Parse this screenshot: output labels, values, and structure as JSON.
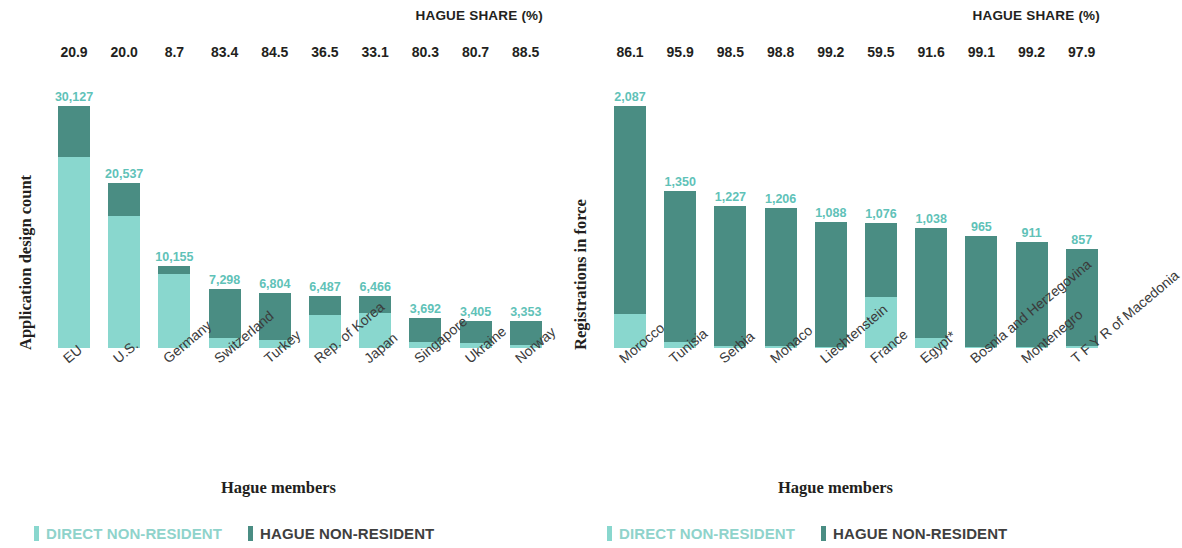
{
  "chart_data": [
    {
      "id": "left",
      "type": "bar",
      "stacked": true,
      "title": "",
      "header_label": "HAGUE SHARE (%)",
      "ylabel": "Application design count",
      "xlabel": "Hague members",
      "categories": [
        "EU",
        "U.S.",
        "Germany",
        "Switzerland",
        "Turkey",
        "Rep. of Korea",
        "Japan",
        "Singapore",
        "Ukraine",
        "Norway"
      ],
      "values": [
        30127,
        20537,
        10155,
        7298,
        6804,
        6487,
        6466,
        3692,
        3405,
        3353
      ],
      "value_labels": [
        "30,127",
        "20,537",
        "10,155",
        "7,298",
        "6,804",
        "6,487",
        "6,466",
        "3,692",
        "3,405",
        "3,353"
      ],
      "hague_share": [
        20.9,
        20.0,
        8.7,
        83.4,
        84.5,
        36.5,
        33.1,
        80.3,
        80.7,
        88.5
      ],
      "hague_share_labels": [
        "20.9",
        "20.0",
        "8.7",
        "83.4",
        "84.5",
        "36.5",
        "33.1",
        "80.3",
        "80.7",
        "88.5"
      ],
      "series": [
        {
          "name": "DIRECT NON-RESIDENT",
          "color": "#89d7ce"
        },
        {
          "name": "HAGUE NON-RESIDENT",
          "color": "#4a8d83"
        }
      ],
      "ylim": [
        0,
        30127
      ],
      "grid": false,
      "legend_position": "bottom-left"
    },
    {
      "id": "right",
      "type": "bar",
      "stacked": true,
      "title": "",
      "header_label": "HAGUE SHARE (%)",
      "ylabel": "Registrations in force",
      "xlabel": "Hague members",
      "categories": [
        "Morocco",
        "Tunisia",
        "Serbia",
        "Monaco",
        "Liechtenstein",
        "France",
        "Egypt*",
        "Bosnia and Herzegovina",
        "Montenegro",
        "T F Y R of Macedonia"
      ],
      "values": [
        2087,
        1350,
        1227,
        1206,
        1088,
        1076,
        1038,
        965,
        911,
        857
      ],
      "value_labels": [
        "2,087",
        "1,350",
        "1,227",
        "1,206",
        "1,088",
        "1,076",
        "1,038",
        "965",
        "911",
        "857"
      ],
      "hague_share": [
        86.1,
        95.9,
        98.5,
        98.8,
        99.2,
        59.5,
        91.6,
        99.1,
        99.2,
        97.9
      ],
      "hague_share_labels": [
        "86.1",
        "95.9",
        "98.5",
        "98.8",
        "99.2",
        "59.5",
        "91.6",
        "99.1",
        "99.2",
        "97.9"
      ],
      "series": [
        {
          "name": "DIRECT NON-RESIDENT",
          "color": "#89d7ce"
        },
        {
          "name": "HAGUE NON-RESIDENT",
          "color": "#4a8d83"
        }
      ],
      "ylim": [
        0,
        2087
      ],
      "grid": false,
      "legend_position": "bottom-left"
    }
  ],
  "legend": {
    "direct_label": "DIRECT NON-RESIDENT",
    "hague_label": "HAGUE NON-RESIDENT"
  },
  "colors": {
    "direct": "#89d7ce",
    "hague": "#4a8d83",
    "value_text": "#5fc2b8",
    "axis_text": "#231f20"
  }
}
